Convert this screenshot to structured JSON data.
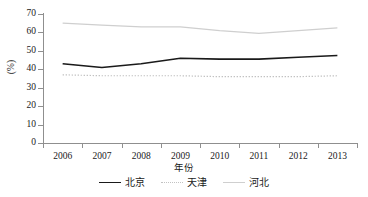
{
  "chart_data": {
    "type": "line",
    "title": "",
    "xlabel": "年份",
    "ylabel": "(%)",
    "categories": [
      "2006",
      "2007",
      "2008",
      "2009",
      "2010",
      "2011",
      "2012",
      "2013"
    ],
    "ylim": [
      0,
      70
    ],
    "yticks": [
      0,
      10,
      20,
      30,
      40,
      50,
      60,
      70
    ],
    "grid": false,
    "legend_position": "bottom",
    "series": [
      {
        "name": "北京",
        "style": "solid",
        "color": "#1a1a1a",
        "values": [
          43.0,
          41.0,
          43.0,
          46.0,
          45.5,
          45.5,
          46.5,
          47.5
        ]
      },
      {
        "name": "天津",
        "style": "dotted",
        "color": "#c2c2c2",
        "values": [
          37.0,
          36.5,
          36.5,
          36.5,
          36.0,
          36.0,
          36.0,
          36.5
        ]
      },
      {
        "name": "河北",
        "style": "solid",
        "color": "#cfcfcf",
        "values": [
          65.0,
          64.0,
          63.0,
          63.0,
          61.0,
          59.5,
          61.0,
          62.5
        ]
      }
    ]
  },
  "axis": {
    "y_title": "(%)",
    "x_title": "年份",
    "ytick_labels": [
      "70",
      "60",
      "50",
      "40",
      "30",
      "20",
      "10",
      "0"
    ],
    "xtick_labels": [
      "2006",
      "2007",
      "2008",
      "2009",
      "2010",
      "2011",
      "2012",
      "2013"
    ]
  },
  "legend": {
    "items": [
      {
        "label": "北京"
      },
      {
        "label": "天津"
      },
      {
        "label": "河北"
      }
    ]
  }
}
